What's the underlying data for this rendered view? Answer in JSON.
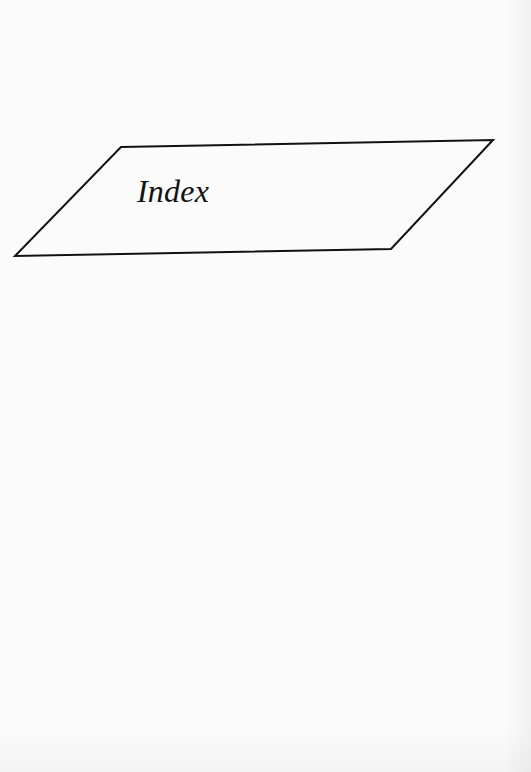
{
  "page": {
    "title": "Index"
  }
}
